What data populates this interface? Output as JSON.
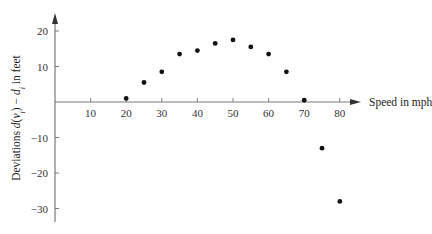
{
  "chart_data": {
    "type": "scatter",
    "title": "",
    "xlabel": "Speed in mph",
    "ylabel": "Deviations d(vᵢ) − dᵢ in feet",
    "ylabel_parts": {
      "prefix": "Deviations ",
      "func": "d",
      "arg_open": "(",
      "arg": "v",
      "arg_sub": "i",
      "arg_close": ")",
      "minus": " − ",
      "var": "d",
      "var_sub": "i",
      "suffix": " in feet"
    },
    "x_ticks": [
      10,
      20,
      30,
      40,
      50,
      60,
      70,
      80
    ],
    "y_ticks": [
      20,
      10,
      -10,
      -20,
      -30
    ],
    "x_tick_labels": [
      "10",
      "20",
      "30",
      "40",
      "50",
      "60",
      "70",
      "80"
    ],
    "y_tick_labels": [
      "20",
      "10",
      "−10",
      "−20",
      "−30"
    ],
    "xlim": [
      0,
      85
    ],
    "ylim": [
      -32,
      24
    ],
    "grid": false,
    "legend": null,
    "series": [
      {
        "name": "Deviations",
        "x": [
          20,
          25,
          30,
          35,
          40,
          45,
          50,
          55,
          60,
          65,
          70,
          75,
          80
        ],
        "y": [
          1,
          5.5,
          8.5,
          13.5,
          14.5,
          16.5,
          17.5,
          15.5,
          13.5,
          8.5,
          0.5,
          -13,
          -28
        ]
      }
    ]
  }
}
